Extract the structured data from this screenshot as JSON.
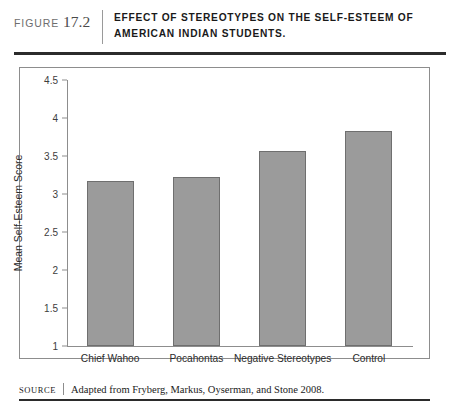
{
  "figure": {
    "label_word": "FIGURE",
    "number": "17.2",
    "title": "EFFECT OF STEREOTYPES ON THE SELF-ESTEEM OF AMERICAN INDIAN STUDENTS."
  },
  "source": {
    "label": "SOURCE",
    "text": "Adapted from Fryberg, Markus, Oyserman, and Stone 2008."
  },
  "colors": {
    "bar_fill": "#9b9b9b",
    "bar_border": "#6f6f6f",
    "axis": "#8d8d8d",
    "rule": "#2b2b2b"
  },
  "chart_data": {
    "type": "bar",
    "title": "",
    "categories": [
      "Chief Wahoo",
      "Pocahontas",
      "Negative Stereotypes",
      "Control"
    ],
    "values": [
      3.17,
      3.22,
      3.57,
      3.83
    ],
    "xlabel": "",
    "ylabel": "Mean Self-Esteem Score",
    "ylim": [
      1,
      4.5
    ],
    "yticks": [
      "1",
      "1.5",
      "2",
      "2.5",
      "3",
      "3.5",
      "4",
      "4.5"
    ],
    "ytick_values": [
      1,
      1.5,
      2,
      2.5,
      3,
      3.5,
      4,
      4.5
    ],
    "grid": false,
    "legend": null
  }
}
